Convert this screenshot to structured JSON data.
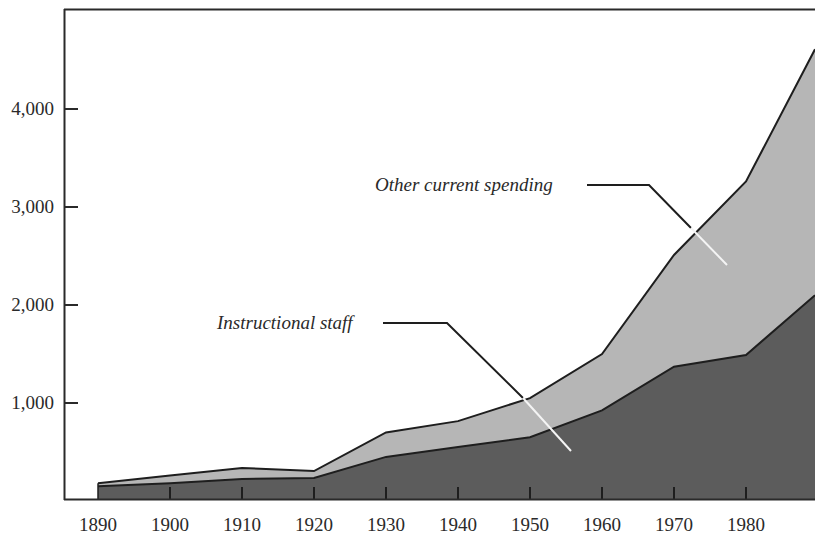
{
  "chart_data": {
    "type": "area",
    "stacked": true,
    "title": "",
    "xlabel": "",
    "ylabel": "",
    "x": [
      1890,
      1900,
      1910,
      1920,
      1930,
      1940,
      1950,
      1960,
      1970,
      1980,
      1990
    ],
    "x_tick_labels": [
      "1890",
      "1900",
      "1910",
      "1920",
      "1930",
      "1940",
      "1950",
      "1960",
      "1970",
      "1980"
    ],
    "y_tick_values": [
      1000,
      2000,
      3000,
      4000
    ],
    "y_tick_labels": [
      "1,000",
      "2,000",
      "3,000",
      "4,000"
    ],
    "ylim": [
      0,
      5000
    ],
    "grid": false,
    "legend": "inline annotations with leader lines",
    "series": [
      {
        "name": "Instructional staff",
        "color": "#5c5c5c",
        "values": [
          150,
          180,
          225,
          235,
          450,
          550,
          650,
          925,
          1370,
          1490,
          2100
        ]
      },
      {
        "name": "Other current spending",
        "color": "#b6b6b6",
        "values": [
          30,
          80,
          112,
          70,
          250,
          265,
          400,
          575,
          1140,
          1770,
          2510
        ]
      }
    ],
    "totals": [
      180,
      260,
      337,
      305,
      700,
      815,
      1050,
      1500,
      2510,
      3260,
      4610
    ]
  },
  "annotations": {
    "other": "Other current spending",
    "instructional": "Instructional staff"
  }
}
